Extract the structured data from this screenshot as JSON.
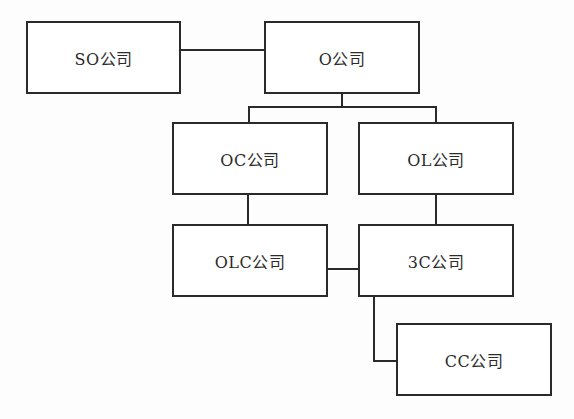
{
  "diagram": {
    "type": "organization-relationship-chart",
    "nodes": [
      {
        "id": "so",
        "label": "SO公司"
      },
      {
        "id": "o",
        "label": "O公司"
      },
      {
        "id": "oc",
        "label": "OC公司"
      },
      {
        "id": "ol",
        "label": "OL公司"
      },
      {
        "id": "olc",
        "label": "OLC公司"
      },
      {
        "id": "3c",
        "label": "3C公司"
      },
      {
        "id": "cc",
        "label": "CC公司"
      }
    ],
    "edges": [
      {
        "from": "so",
        "to": "o"
      },
      {
        "from": "o",
        "to": "oc"
      },
      {
        "from": "o",
        "to": "ol"
      },
      {
        "from": "oc",
        "to": "olc"
      },
      {
        "from": "ol",
        "to": "3c"
      },
      {
        "from": "olc",
        "to": "3c"
      },
      {
        "from": "3c",
        "to": "cc"
      }
    ],
    "colors": {
      "stroke": "#2a2a2a",
      "fill": "#ffffff",
      "text": "#2b2b2b"
    }
  }
}
